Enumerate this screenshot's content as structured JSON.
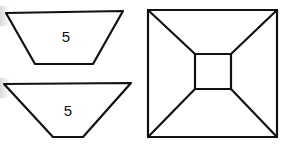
{
  "figure": {
    "shapes": [
      {
        "name": "top-trapezoid",
        "label": "5"
      },
      {
        "name": "bottom-trapezoid",
        "label": "5"
      },
      {
        "name": "square-frustum-topview",
        "label": ""
      }
    ]
  },
  "colors": {
    "stroke": "#111111",
    "background": "#ffffff"
  }
}
